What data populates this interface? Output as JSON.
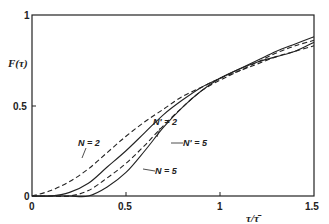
{
  "chart_data": {
    "type": "line",
    "title": "",
    "xlabel": "τ/τ̄",
    "ylabel": "F(τ)",
    "xlim": [
      0,
      1.5
    ],
    "ylim": [
      0,
      1
    ],
    "xticks": [
      0,
      0.5,
      1,
      1.5
    ],
    "xtick_labels": [
      "0",
      "0.5",
      "1",
      "1.5"
    ],
    "yticks": [
      0,
      0.5,
      1
    ],
    "ytick_labels": [
      "0",
      "0.5",
      "1"
    ],
    "grid": false,
    "legend": "inline labels with leader lines",
    "x": [
      0,
      0.1,
      0.2,
      0.3,
      0.4,
      0.5,
      0.6,
      0.7,
      0.8,
      0.9,
      1.0,
      1.1,
      1.2,
      1.3,
      1.4,
      1.5
    ],
    "series": [
      {
        "name": "N = 2",
        "style": "dashed",
        "label": "N = 2",
        "values": [
          0,
          0.03,
          0.08,
          0.15,
          0.24,
          0.33,
          0.41,
          0.48,
          0.55,
          0.6,
          0.65,
          0.69,
          0.73,
          0.77,
          0.8,
          0.83
        ]
      },
      {
        "name": "N' = 2",
        "style": "solid",
        "label": "N' = 2",
        "values": [
          0,
          0.0,
          0.02,
          0.07,
          0.16,
          0.25,
          0.35,
          0.45,
          0.53,
          0.6,
          0.65,
          0.7,
          0.75,
          0.8,
          0.84,
          0.88
        ]
      },
      {
        "name": "N' = 5",
        "style": "dashed",
        "label": "N' = 5",
        "values": [
          0,
          0.0,
          0.0,
          0.03,
          0.1,
          0.18,
          0.28,
          0.39,
          0.49,
          0.58,
          0.64,
          0.69,
          0.74,
          0.79,
          0.83,
          0.86
        ]
      },
      {
        "name": "N = 5",
        "style": "solid",
        "label": "N = 5",
        "values": [
          0,
          0.0,
          0.0,
          0.0,
          0.05,
          0.13,
          0.25,
          0.38,
          0.49,
          0.58,
          0.65,
          0.7,
          0.74,
          0.77,
          0.8,
          0.85
        ]
      }
    ]
  },
  "labels": {
    "y_axis": "F(τ)",
    "x_axis": "τ/τ̄",
    "x0": "0",
    "x05": "0.5",
    "x1": "1",
    "x15": "1.5",
    "y0": "0",
    "y05": "0.5",
    "y1": "1",
    "n2": "N = 2",
    "np2": "N' = 2",
    "np5": "N' = 5",
    "n5": "N = 5"
  }
}
